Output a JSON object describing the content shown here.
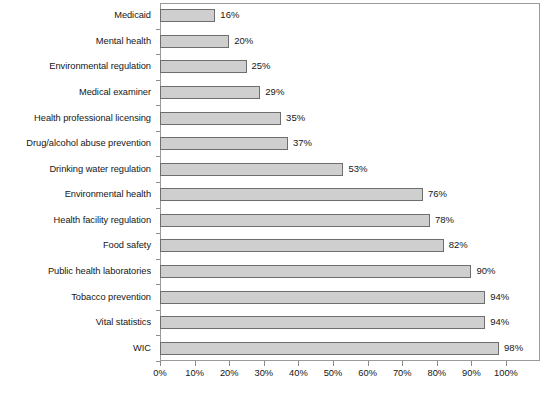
{
  "chart_data": {
    "type": "bar",
    "orientation": "horizontal",
    "title": "",
    "subtitle": "",
    "xlabel": "",
    "ylabel": "",
    "xlim": [
      0,
      100
    ],
    "xtick_step": 10,
    "grid": false,
    "legend": null,
    "value_label_suffix": "%",
    "bar_fill_color": "#cfcfcf",
    "bar_border_color": "#6e6e6e",
    "axis_color": "#8c8c8c",
    "text_color": "#161616",
    "categories": [
      "Medicaid",
      "Mental health",
      "Environmental regulation",
      "Medical examiner",
      "Health professional licensing",
      "Drug/alcohol abuse prevention",
      "Drinking water regulation",
      "Environmental health",
      "Health facility regulation",
      "Food safety",
      "Public health laboratories",
      "Tobacco prevention",
      "Vital statistics",
      "WIC"
    ],
    "values": [
      16,
      20,
      25,
      29,
      35,
      37,
      53,
      76,
      78,
      82,
      90,
      94,
      94,
      98
    ],
    "value_labels": [
      "16%",
      "20%",
      "25%",
      "29%",
      "35%",
      "37%",
      "53%",
      "76%",
      "78%",
      "82%",
      "90%",
      "94%",
      "94%",
      "98%"
    ],
    "xticks": [
      0,
      10,
      20,
      30,
      40,
      50,
      60,
      70,
      80,
      90,
      100
    ],
    "xtick_labels": [
      "0%",
      "10%",
      "20%",
      "30%",
      "40%",
      "50%",
      "60%",
      "70%",
      "80%",
      "90%",
      "100%"
    ]
  }
}
